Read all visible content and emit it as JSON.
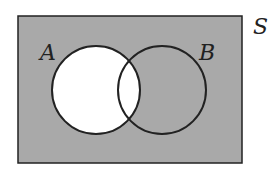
{
  "diagram": {
    "type": "venn",
    "universe_label": "S",
    "sets": [
      {
        "label": "A"
      },
      {
        "label": "B"
      }
    ],
    "colors": {
      "shaded": "#a9a9a9",
      "unshaded": "#ffffff",
      "stroke": "#222222"
    }
  }
}
